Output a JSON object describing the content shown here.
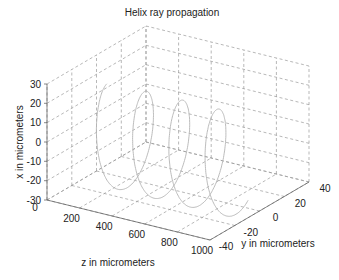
{
  "chart_data": {
    "type": "line3d",
    "title": "Helix ray propagation",
    "xlabel": "z in micrometers",
    "ylabel": "y in micrometers",
    "zlabel": "x in micrometers",
    "axes": {
      "z": {
        "range": [
          0,
          1000
        ],
        "ticks": [
          0,
          200,
          400,
          600,
          800,
          1000
        ]
      },
      "y": {
        "range": [
          -40,
          40
        ],
        "ticks": [
          -40,
          -20,
          0,
          20,
          40
        ]
      },
      "x": {
        "range": [
          -30,
          30
        ],
        "ticks": [
          -30,
          -20,
          -10,
          0,
          10,
          20,
          30
        ]
      }
    },
    "grid": true,
    "series": [
      {
        "name": "helix ray",
        "kind": "parametric-helix",
        "z_start": 200,
        "z_end": 1000,
        "turns": 3.6,
        "center_x": 0,
        "center_y": -18,
        "radius_x": 26,
        "radius_y": 15,
        "color": "#b4b4b4"
      }
    ]
  },
  "colors": {
    "axis": "#555555",
    "grid": "#9a9a9a",
    "text": "#222222",
    "background": "#ffffff"
  }
}
